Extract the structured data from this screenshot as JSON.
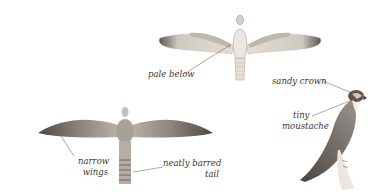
{
  "illustration": {
    "subject": "falcon field-guide plate",
    "figures": [
      {
        "id": "top-flight",
        "view": "underside in flight"
      },
      {
        "id": "bottom-flight",
        "view": "upperside in flight"
      },
      {
        "id": "perched",
        "view": "perched side view"
      }
    ]
  },
  "labels": {
    "pale_below": "pale below",
    "sandy_crown": "sandy crown",
    "tiny": "tiny",
    "moustache": "moustache",
    "narrow": "narrow",
    "wings": "wings",
    "neatly_barred": "neatly barred",
    "tail": "tail"
  },
  "colors": {
    "background": "#ffffff",
    "text": "#3a3632",
    "leader_line": "#555555",
    "plumage_light": "#d9d2c8",
    "plumage_dark": "#6a625c"
  }
}
